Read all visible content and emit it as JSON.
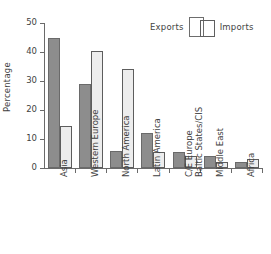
{
  "chart_data": {
    "type": "bar",
    "title": "",
    "xlabel": "",
    "ylabel": "Percentage",
    "ylim": [
      0,
      50
    ],
    "yticks": [
      0,
      10,
      20,
      30,
      40,
      50
    ],
    "grid": false,
    "legend_position": "top-right",
    "categories": [
      "Asia",
      "Western Europe",
      "North America",
      "Latin America",
      "C/E Europe Baltic States/CIS",
      "Middle East",
      "Africa"
    ],
    "category_lines": [
      [
        "Asia"
      ],
      [
        "Western Europe"
      ],
      [
        "North America"
      ],
      [
        "Latin America"
      ],
      [
        "C/E Europe",
        "Baltic States/CIS"
      ],
      [
        "Middle East"
      ],
      [
        "Africa"
      ]
    ],
    "series": [
      {
        "name": "Exports",
        "color": "#8d8d8d",
        "values": [
          45,
          29,
          6,
          12,
          5.5,
          4,
          2
        ]
      },
      {
        "name": "Imports",
        "color": "#ededed",
        "values": [
          14.5,
          40.5,
          34,
          5.5,
          4,
          2,
          3
        ]
      }
    ]
  },
  "legend": {
    "exports_label": "Exports",
    "imports_label": "Imports"
  },
  "axis": {
    "y_title": "Percentage",
    "tick_labels": [
      "50",
      "40",
      "30",
      "20",
      "10",
      "0"
    ]
  }
}
